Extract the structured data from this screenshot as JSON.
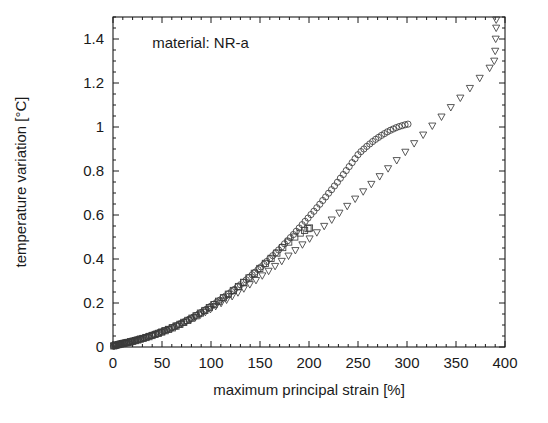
{
  "chart_data": {
    "type": "scatter",
    "title": "",
    "xlabel": "maximum principal strain [%]",
    "ylabel": "temperature variation [°C]",
    "xlim": [
      0,
      400
    ],
    "ylim": [
      0,
      1.5
    ],
    "xticks": [
      0,
      50,
      100,
      150,
      200,
      250,
      300,
      350,
      400
    ],
    "xtick_labels": [
      "0",
      "50",
      "100",
      "150",
      "200",
      "250",
      "300",
      "350",
      "400"
    ],
    "yticks": [
      0,
      0.2,
      0.4,
      0.6,
      0.8,
      1.0,
      1.2,
      1.4
    ],
    "ytick_labels": [
      "0",
      "0.2",
      "0.4",
      "0.6",
      "0.8",
      "1",
      "1.2",
      "1.4"
    ],
    "x_minor_step": 10,
    "y_minor_step": 0.05,
    "grid": false,
    "legend": null,
    "frame": true,
    "tick_direction": "in",
    "annotations": [
      {
        "text": "material: NR-a",
        "x": 40,
        "y": 1.36
      }
    ],
    "marker_color": "#3b3b3b",
    "series": [
      {
        "name": "circles",
        "marker": "circle",
        "points": [
          [
            0.5,
            0.004
          ],
          [
            1.2,
            0.006
          ],
          [
            2.0,
            0.007
          ],
          [
            2.8,
            0.008
          ],
          [
            3.6,
            0.009
          ],
          [
            4.5,
            0.01
          ],
          [
            5.4,
            0.011
          ],
          [
            6.3,
            0.012
          ],
          [
            7.2,
            0.013
          ],
          [
            8.2,
            0.014
          ],
          [
            9.2,
            0.015
          ],
          [
            10.3,
            0.016
          ],
          [
            11.4,
            0.017
          ],
          [
            12.6,
            0.018
          ],
          [
            13.8,
            0.019
          ],
          [
            15.0,
            0.02
          ],
          [
            16.3,
            0.022
          ],
          [
            17.6,
            0.023
          ],
          [
            19.0,
            0.025
          ],
          [
            20.4,
            0.026
          ],
          [
            21.9,
            0.028
          ],
          [
            23.4,
            0.03
          ],
          [
            25.0,
            0.032
          ],
          [
            26.6,
            0.034
          ],
          [
            28.3,
            0.036
          ],
          [
            30.0,
            0.038
          ],
          [
            31.8,
            0.041
          ],
          [
            33.6,
            0.043
          ],
          [
            35.5,
            0.046
          ],
          [
            37.4,
            0.049
          ],
          [
            39.4,
            0.052
          ],
          [
            41.4,
            0.055
          ],
          [
            43.5,
            0.058
          ],
          [
            45.6,
            0.061
          ],
          [
            47.8,
            0.065
          ],
          [
            50.0,
            0.068
          ],
          [
            52.5,
            0.073
          ],
          [
            55.0,
            0.077
          ],
          [
            57.5,
            0.082
          ],
          [
            60.0,
            0.087
          ],
          [
            62.5,
            0.092
          ],
          [
            65.0,
            0.097
          ],
          [
            67.5,
            0.102
          ],
          [
            70.0,
            0.108
          ],
          [
            72.5,
            0.113
          ],
          [
            75.0,
            0.119
          ],
          [
            77.5,
            0.125
          ],
          [
            80.0,
            0.131
          ],
          [
            82.5,
            0.137
          ],
          [
            85.0,
            0.144
          ],
          [
            87.5,
            0.15
          ],
          [
            90.0,
            0.157
          ],
          [
            92.5,
            0.164
          ],
          [
            95.0,
            0.171
          ],
          [
            97.5,
            0.178
          ],
          [
            100.0,
            0.186
          ],
          [
            103.0,
            0.195
          ],
          [
            106.0,
            0.204
          ],
          [
            109.0,
            0.213
          ],
          [
            112.0,
            0.223
          ],
          [
            115.0,
            0.232
          ],
          [
            118.0,
            0.242
          ],
          [
            121.0,
            0.252
          ],
          [
            124.0,
            0.262
          ],
          [
            127.0,
            0.273
          ],
          [
            130.0,
            0.283
          ],
          [
            133.0,
            0.294
          ],
          [
            136.0,
            0.305
          ],
          [
            139.0,
            0.317
          ],
          [
            142.0,
            0.328
          ],
          [
            145.0,
            0.34
          ],
          [
            148.0,
            0.352
          ],
          [
            151.0,
            0.364
          ],
          [
            154.0,
            0.376
          ],
          [
            157.0,
            0.389
          ],
          [
            160.0,
            0.402
          ],
          [
            163.0,
            0.415
          ],
          [
            166.0,
            0.428
          ],
          [
            169.0,
            0.441
          ],
          [
            172.0,
            0.455
          ],
          [
            175.0,
            0.469
          ],
          [
            178.0,
            0.483
          ],
          [
            181.0,
            0.497
          ],
          [
            184.0,
            0.511
          ],
          [
            187.0,
            0.526
          ],
          [
            190.0,
            0.541
          ],
          [
            193.0,
            0.556
          ],
          [
            196.0,
            0.571
          ],
          [
            199.0,
            0.586
          ],
          [
            202.0,
            0.602
          ],
          [
            205.0,
            0.617
          ],
          [
            208.0,
            0.633
          ],
          [
            211.0,
            0.649
          ],
          [
            214.0,
            0.666
          ],
          [
            217.0,
            0.682
          ],
          [
            220.0,
            0.699
          ],
          [
            223.0,
            0.715
          ],
          [
            226.0,
            0.732
          ],
          [
            229.0,
            0.749
          ],
          [
            232.0,
            0.767
          ],
          [
            235.0,
            0.784
          ],
          [
            238.0,
            0.802
          ],
          [
            241.0,
            0.82
          ],
          [
            244.0,
            0.838
          ],
          [
            247.0,
            0.856
          ],
          [
            250.0,
            0.874
          ],
          [
            253.0,
            0.888
          ],
          [
            256.0,
            0.9
          ],
          [
            259.0,
            0.912
          ],
          [
            262.0,
            0.923
          ],
          [
            265.0,
            0.934
          ],
          [
            268.0,
            0.944
          ],
          [
            271.0,
            0.953
          ],
          [
            274.0,
            0.962
          ],
          [
            277.0,
            0.97
          ],
          [
            280.0,
            0.978
          ],
          [
            283.0,
            0.985
          ],
          [
            286.0,
            0.991
          ],
          [
            289.0,
            0.997
          ],
          [
            292.0,
            1.002
          ],
          [
            295.0,
            1.006
          ],
          [
            298.0,
            1.01
          ],
          [
            301.0,
            1.013
          ]
        ]
      },
      {
        "name": "squares",
        "marker": "square",
        "points": [
          [
            0.8,
            0.005
          ],
          [
            2.2,
            0.007
          ],
          [
            3.8,
            0.009
          ],
          [
            5.5,
            0.011
          ],
          [
            7.3,
            0.013
          ],
          [
            9.2,
            0.015
          ],
          [
            11.2,
            0.017
          ],
          [
            13.3,
            0.019
          ],
          [
            15.5,
            0.021
          ],
          [
            17.8,
            0.024
          ],
          [
            20.2,
            0.026
          ],
          [
            22.7,
            0.029
          ],
          [
            25.3,
            0.032
          ],
          [
            28.0,
            0.036
          ],
          [
            30.8,
            0.039
          ],
          [
            33.7,
            0.043
          ],
          [
            36.7,
            0.047
          ],
          [
            39.8,
            0.052
          ],
          [
            43.0,
            0.057
          ],
          [
            46.3,
            0.062
          ],
          [
            49.7,
            0.068
          ],
          [
            53.2,
            0.074
          ],
          [
            56.8,
            0.08
          ],
          [
            60.5,
            0.087
          ],
          [
            64.3,
            0.095
          ],
          [
            68.2,
            0.103
          ],
          [
            72.2,
            0.112
          ],
          [
            76.3,
            0.121
          ],
          [
            80.5,
            0.131
          ],
          [
            84.8,
            0.142
          ],
          [
            89.2,
            0.154
          ],
          [
            93.7,
            0.166
          ],
          [
            98.3,
            0.179
          ],
          [
            103.0,
            0.193
          ],
          [
            107.8,
            0.208
          ],
          [
            112.7,
            0.224
          ],
          [
            117.7,
            0.24
          ],
          [
            122.8,
            0.257
          ],
          [
            128.0,
            0.275
          ],
          [
            133.3,
            0.294
          ],
          [
            138.7,
            0.314
          ],
          [
            144.2,
            0.335
          ],
          [
            149.8,
            0.357
          ],
          [
            155.5,
            0.38
          ],
          [
            161.3,
            0.403
          ],
          [
            167.2,
            0.427
          ],
          [
            173.2,
            0.452
          ],
          [
            179.3,
            0.477
          ],
          [
            185.5,
            0.5
          ],
          [
            191.0,
            0.518
          ],
          [
            195.5,
            0.53
          ],
          [
            199.0,
            0.538
          ],
          [
            200.5,
            0.541
          ]
        ]
      },
      {
        "name": "triangles",
        "marker": "triangle",
        "points": [
          [
            1.0,
            0.005
          ],
          [
            3.0,
            0.008
          ],
          [
            5.2,
            0.01
          ],
          [
            7.5,
            0.013
          ],
          [
            10.0,
            0.016
          ],
          [
            12.6,
            0.018
          ],
          [
            15.3,
            0.021
          ],
          [
            18.1,
            0.024
          ],
          [
            21.0,
            0.027
          ],
          [
            24.0,
            0.031
          ],
          [
            27.2,
            0.035
          ],
          [
            30.5,
            0.039
          ],
          [
            33.9,
            0.044
          ],
          [
            37.4,
            0.049
          ],
          [
            41.0,
            0.054
          ],
          [
            44.8,
            0.06
          ],
          [
            48.7,
            0.066
          ],
          [
            52.7,
            0.073
          ],
          [
            56.8,
            0.08
          ],
          [
            61.0,
            0.088
          ],
          [
            65.4,
            0.096
          ],
          [
            69.9,
            0.105
          ],
          [
            74.5,
            0.114
          ],
          [
            79.2,
            0.124
          ],
          [
            84.1,
            0.135
          ],
          [
            89.1,
            0.146
          ],
          [
            94.2,
            0.158
          ],
          [
            99.4,
            0.171
          ],
          [
            104.8,
            0.185
          ],
          [
            110.3,
            0.199
          ],
          [
            115.9,
            0.214
          ],
          [
            121.6,
            0.23
          ],
          [
            127.5,
            0.247
          ],
          [
            133.5,
            0.265
          ],
          [
            139.6,
            0.284
          ],
          [
            145.9,
            0.303
          ],
          [
            152.3,
            0.324
          ],
          [
            158.8,
            0.345
          ],
          [
            165.4,
            0.367
          ],
          [
            172.2,
            0.39
          ],
          [
            179.1,
            0.414
          ],
          [
            186.1,
            0.439
          ],
          [
            193.3,
            0.465
          ],
          [
            200.6,
            0.492
          ],
          [
            208.0,
            0.52
          ],
          [
            215.5,
            0.549
          ],
          [
            223.2,
            0.578
          ],
          [
            231.0,
            0.609
          ],
          [
            239.0,
            0.64
          ],
          [
            247.1,
            0.673
          ],
          [
            255.3,
            0.706
          ],
          [
            263.6,
            0.74
          ],
          [
            272.1,
            0.775
          ],
          [
            280.7,
            0.811
          ],
          [
            289.5,
            0.848
          ],
          [
            298.3,
            0.886
          ],
          [
            307.3,
            0.925
          ],
          [
            316.5,
            0.964
          ],
          [
            325.8,
            1.005
          ],
          [
            335.2,
            1.046
          ],
          [
            344.7,
            1.089
          ],
          [
            354.4,
            1.132
          ],
          [
            364.2,
            1.176
          ],
          [
            374.2,
            1.222
          ],
          [
            384.3,
            1.268
          ],
          [
            389.0,
            1.3
          ],
          [
            390.0,
            1.345
          ],
          [
            390.5,
            1.4
          ],
          [
            391.0,
            1.45
          ],
          [
            391.0,
            1.487
          ]
        ]
      }
    ]
  }
}
